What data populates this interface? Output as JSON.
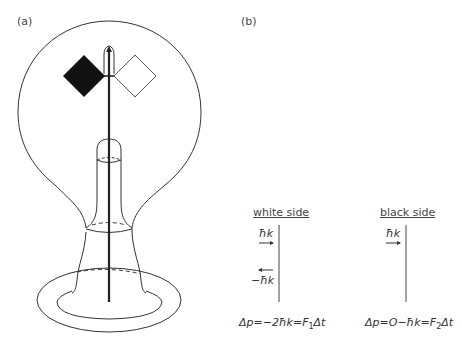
{
  "panel_a": {
    "label": "(a)",
    "description": "Crookes radiometer: glass bulb with vanes on a vertical spindle",
    "vanes": [
      {
        "name": "black vane",
        "fill": "#111111"
      },
      {
        "name": "white vane",
        "fill": "#ffffff"
      }
    ]
  },
  "panel_b": {
    "label": "(b)",
    "white_side": {
      "heading": "white side",
      "incoming": "ħk",
      "reflected": "−ħk",
      "equation_prefix": "Δp=−2ħk=",
      "equation_F": "F",
      "equation_sub": "1",
      "equation_suffix": "Δt"
    },
    "black_side": {
      "heading": "black side",
      "incoming": "ħk",
      "equation_prefix": "Δp=O−ħk=",
      "equation_F": "F",
      "equation_sub": "2",
      "equation_suffix": "Δt"
    }
  },
  "colors": {
    "line": "#333333",
    "black_vane": "#111111"
  }
}
